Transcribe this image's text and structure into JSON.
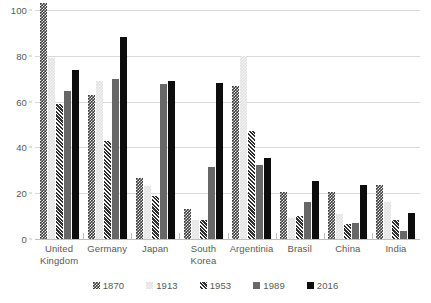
{
  "chart_data": {
    "type": "bar",
    "title": "",
    "subtitle": "",
    "xlabel": "",
    "ylabel": "",
    "ylim": [
      0,
      100
    ],
    "y_ticks": [
      0,
      20,
      40,
      60,
      80,
      100
    ],
    "grid": true,
    "legend_position": "bottom",
    "categories": [
      "United\nKingdom",
      "Germany",
      "Japan",
      "South\nKorea",
      "Argentinia",
      "Brasil",
      "China",
      "India"
    ],
    "series": [
      {
        "name": "1870",
        "color": "#3a3a3a",
        "pattern": "checkerboard-dark",
        "values": [
          103,
          63,
          26.5,
          13,
          67,
          20.5,
          20.5,
          23.5
        ]
      },
      {
        "name": "1913",
        "color": "#e2e2e2",
        "pattern": "checkerboard-light",
        "values": [
          79,
          69,
          23,
          8.5,
          80,
          9,
          11,
          16
        ]
      },
      {
        "name": "1953",
        "color": "#2f2f2f",
        "pattern": "diagonal-stripes",
        "values": [
          59,
          43,
          19,
          8.5,
          47,
          10,
          6.5,
          8.5
        ]
      },
      {
        "name": "1989",
        "color": "#676767",
        "pattern": "solid",
        "values": [
          64.5,
          70,
          67.5,
          31.5,
          32.5,
          16,
          7,
          3.5
        ]
      },
      {
        "name": "2016",
        "color": "#0d0d0d",
        "pattern": "solid",
        "values": [
          74,
          88,
          69,
          68,
          35.5,
          25.5,
          23.5,
          11.5
        ]
      }
    ]
  },
  "axis": {
    "y_tick_labels": [
      "0",
      "20",
      "40",
      "60",
      "80",
      "100"
    ]
  },
  "legend": {
    "entries": [
      "1870",
      "1913",
      "1953",
      "1989",
      "2016"
    ]
  }
}
